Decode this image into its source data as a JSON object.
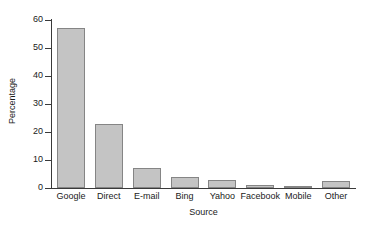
{
  "chart_data": {
    "type": "bar",
    "title": "",
    "subtitle": "",
    "xlabel": "Source",
    "ylabel": "Percentage",
    "categories": [
      "Google",
      "Direct",
      "E-mail",
      "Bing",
      "Yahoo",
      "Facebook",
      "Mobile",
      "Other"
    ],
    "values": [
      57,
      23,
      7,
      4,
      3,
      1,
      0.5,
      2.5
    ],
    "ylim": [
      0,
      60
    ],
    "yticks": [
      0,
      10,
      20,
      30,
      40,
      50,
      60
    ],
    "ytick_labels": [
      "0",
      "10",
      "20",
      "30",
      "40",
      "50",
      "60"
    ],
    "grid": false,
    "legend": null,
    "bar_fill_color": "#c4c4c4",
    "bar_border_color": "#858585",
    "axis_color": "#3a3a3a",
    "background_color": "#ffffff"
  }
}
